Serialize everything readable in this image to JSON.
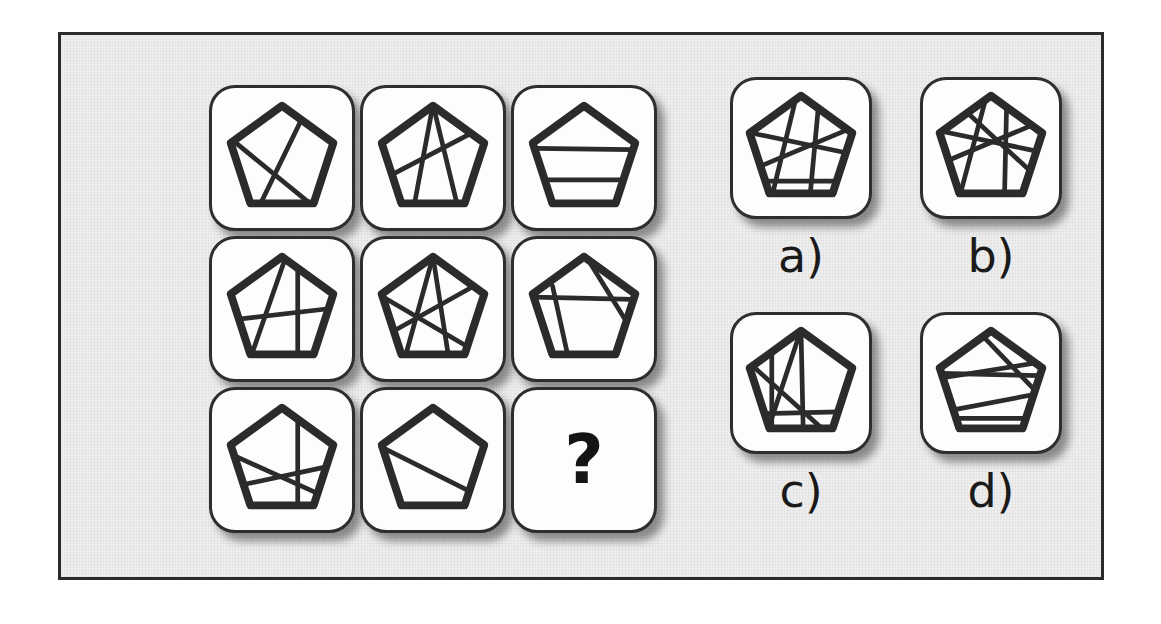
{
  "puzzle": {
    "type": "matrix-reasoning",
    "figure_shape": "pentagon",
    "question_mark": "?",
    "colors": {
      "panel_background": "#eeeeee",
      "panel_border": "#2b2b2b",
      "tile_background": "#fdfdfd",
      "tile_border": "#2e2e2e",
      "stroke": "#2b2b2b",
      "page_background": "#ffffff"
    },
    "matrix": {
      "rows": 3,
      "columns": 3,
      "cells": [
        {
          "position": "r1c1",
          "content": "pentagon-with-chords",
          "chord_count": 2,
          "chords": [
            [
              10,
              40,
              80,
              97
            ],
            [
              30,
              95,
              68,
              17
            ]
          ]
        },
        {
          "position": "r1c2",
          "content": "pentagon-with-chords",
          "chord_count": 3,
          "chords": [
            [
              50,
              5,
              33,
              96
            ],
            [
              50,
              5,
              72,
              96
            ],
            [
              12,
              68,
              85,
              30
            ]
          ]
        },
        {
          "position": "r1c3",
          "content": "pentagon-with-chords",
          "chord_count": 2,
          "chords": [
            [
              7,
              44,
              92,
              45
            ],
            [
              9,
              72,
              88,
              72
            ]
          ]
        },
        {
          "position": "r2c1",
          "content": "pentagon-with-chords",
          "chord_count": 3,
          "chords": [
            [
              64,
              12,
              64,
              96
            ],
            [
              8,
              62,
              94,
              52
            ],
            [
              52,
              10,
              22,
              96
            ]
          ]
        },
        {
          "position": "r2c2",
          "content": "pentagon-with-chords",
          "chord_count": 4,
          "chords": [
            [
              50,
              6,
              25,
              96
            ],
            [
              50,
              6,
              64,
              96
            ],
            [
              6,
              42,
              84,
              88
            ],
            [
              8,
              76,
              90,
              30
            ]
          ]
        },
        {
          "position": "r2c3",
          "content": "pentagon-with-chords",
          "chord_count": 3,
          "chords": [
            [
              5,
              42,
              95,
              44
            ],
            [
              22,
              32,
              36,
              96
            ],
            [
              52,
              6,
              88,
              64
            ]
          ]
        },
        {
          "position": "r3c1",
          "content": "pentagon-with-chords",
          "chord_count": 3,
          "chords": [
            [
              64,
              12,
              64,
              96
            ],
            [
              6,
              48,
              90,
              86
            ],
            [
              8,
              76,
              92,
              58
            ]
          ]
        },
        {
          "position": "r3c2",
          "content": "pentagon-with-chords",
          "chord_count": 1,
          "chords": [
            [
              6,
              42,
              90,
              84
            ]
          ]
        },
        {
          "position": "r3c3",
          "content": "question-mark",
          "chord_count": 0,
          "chords": []
        }
      ]
    },
    "options": [
      {
        "label": "a)",
        "key": "a",
        "content": "pentagon-with-chords",
        "chord_count": 5,
        "chords": [
          [
            46,
            6,
            24,
            96
          ],
          [
            10,
            40,
            96,
            58
          ],
          [
            6,
            72,
            92,
            36
          ],
          [
            8,
            82,
            90,
            82
          ],
          [
            66,
            10,
            58,
            96
          ]
        ]
      },
      {
        "label": "b)",
        "key": "b",
        "content": "pentagon-with-chords",
        "chord_count": 5,
        "chords": [
          [
            46,
            6,
            22,
            96
          ],
          [
            8,
            38,
            94,
            56
          ],
          [
            6,
            66,
            92,
            30
          ],
          [
            64,
            10,
            62,
            96
          ],
          [
            30,
            22,
            86,
            74
          ]
        ]
      },
      {
        "label": "c)",
        "key": "c",
        "content": "pentagon-with-chords",
        "chord_count": 5,
        "chords": [
          [
            50,
            5,
            20,
            96
          ],
          [
            50,
            5,
            52,
            96
          ],
          [
            10,
            40,
            72,
            96
          ],
          [
            8,
            80,
            92,
            78
          ],
          [
            24,
            26,
            24,
            96
          ]
        ]
      },
      {
        "label": "d)",
        "key": "d",
        "content": "pentagon-with-chords",
        "chord_count": 5,
        "chords": [
          [
            5,
            44,
            95,
            46
          ],
          [
            6,
            48,
            94,
            34
          ],
          [
            8,
            78,
            92,
            62
          ],
          [
            10,
            84,
            90,
            84
          ],
          [
            40,
            8,
            92,
            62
          ]
        ]
      }
    ]
  }
}
